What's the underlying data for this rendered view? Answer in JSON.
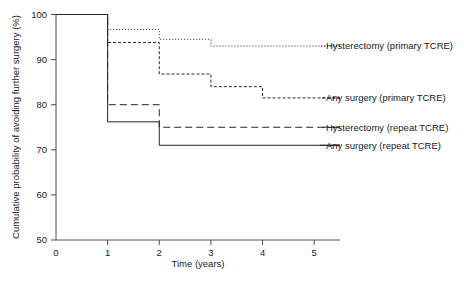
{
  "chart_data": {
    "type": "line",
    "subtype": "kaplan-meier-step",
    "title": "",
    "xlabel": "Time (years)",
    "ylabel": "Cumulative probability of avoiding further surgery (%)",
    "xlim": [
      0,
      5.5
    ],
    "ylim": [
      50,
      100
    ],
    "xticks": [
      0,
      1,
      2,
      3,
      4,
      5
    ],
    "xtick_labels": [
      "0",
      "1",
      "2",
      "3",
      "4",
      "5"
    ],
    "yticks": [
      50,
      60,
      70,
      80,
      90,
      100
    ],
    "ytick_labels": [
      "50",
      "60",
      "70",
      "80",
      "90",
      "100"
    ],
    "grid": false,
    "legend_position": "right-inline",
    "series": [
      {
        "name": "Hysterectomy (primary TCRE)",
        "dash": "dotted",
        "dasharray": "1,2",
        "x": [
          0,
          1,
          1,
          2,
          2,
          3,
          3,
          5.5
        ],
        "y": [
          100,
          100,
          96.7,
          96.7,
          94.5,
          94.5,
          93.0,
          93.0
        ],
        "steps": [
          {
            "time": 0,
            "value": 100
          },
          {
            "time": 1,
            "value": 96.7
          },
          {
            "time": 2,
            "value": 94.5
          },
          {
            "time": 3,
            "value": 93.0
          }
        ],
        "legend_y": 93.0
      },
      {
        "name": "Any surgery (primary TCRE)",
        "dash": "short-dash",
        "dasharray": "3,2",
        "x": [
          0,
          1,
          1,
          2,
          2,
          3,
          3,
          4,
          4,
          5.5
        ],
        "y": [
          100,
          100,
          93.8,
          93.8,
          86.8,
          86.8,
          84.0,
          84.0,
          81.5,
          81.5
        ],
        "steps": [
          {
            "time": 0,
            "value": 100
          },
          {
            "time": 1,
            "value": 93.8
          },
          {
            "time": 2,
            "value": 86.8
          },
          {
            "time": 3,
            "value": 84.0
          },
          {
            "time": 4,
            "value": 81.5
          }
        ],
        "legend_y": 81.5
      },
      {
        "name": "Hysterectomy (repeat TCRE)",
        "dash": "long-dash",
        "dasharray": "7,4",
        "x": [
          0,
          1,
          1,
          2,
          2,
          5.5
        ],
        "y": [
          100,
          100,
          80.0,
          80.0,
          75.0,
          75.0
        ],
        "steps": [
          {
            "time": 0,
            "value": 100
          },
          {
            "time": 1,
            "value": 80.0
          },
          {
            "time": 2,
            "value": 75.0
          }
        ],
        "legend_y": 75.0
      },
      {
        "name": "Any surgery (repeat TCRE)",
        "dash": "solid",
        "dasharray": "none",
        "x": [
          0,
          1,
          1,
          2,
          2,
          5.5
        ],
        "y": [
          100,
          100,
          76.2,
          76.2,
          71.0,
          71.0
        ],
        "steps": [
          {
            "time": 0,
            "value": 100
          },
          {
            "time": 1,
            "value": 76.2
          },
          {
            "time": 2,
            "value": 71.0
          }
        ],
        "legend_y": 71.0
      }
    ]
  },
  "legend": {
    "items": [
      {
        "label": "Hysterectomy (primary TCRE)"
      },
      {
        "label": "Any surgery (primary TCRE)"
      },
      {
        "label": "Hysterectomy (repeat TCRE)"
      },
      {
        "label": "Any surgery (repeat TCRE)"
      }
    ]
  },
  "axes": {
    "x_title": "Time (years)",
    "y_title": "Cumulative probability of avoiding further surgery (%)",
    "x_tick_labels": [
      "0",
      "1",
      "2",
      "3",
      "4",
      "5"
    ],
    "y_tick_labels": [
      "50",
      "60",
      "70",
      "80",
      "90",
      "100"
    ]
  }
}
